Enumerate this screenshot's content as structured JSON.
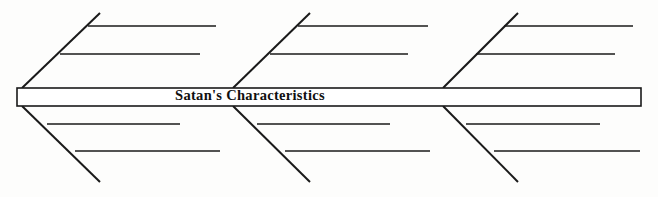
{
  "canvas": {
    "width": 658,
    "height": 197,
    "background_color": "#fdfdfc",
    "ink_color": "#1a1a1a"
  },
  "diagram": {
    "type": "fishbone",
    "alt_name": "Ishikawa cause-and-effect diagram",
    "effect_label": "Satan's Characteristics",
    "spine": {
      "x1": 17,
      "y1": 88,
      "x2": 641,
      "y2": 106,
      "stroke_width": 1.6,
      "fill_color": "#ffffff",
      "stroke_color": "#1a1a1a"
    },
    "label": {
      "text": "Satan's Characteristics",
      "center_x": 250,
      "center_y": 97,
      "font_size": 14.5,
      "bold": true,
      "color": "#101010"
    },
    "categories": [
      {
        "id": "left-upper",
        "position": "upper",
        "label": "",
        "main_bone": {
          "x1": 22,
          "y1": 88,
          "x2": 100,
          "y2": 13,
          "stroke_width": 2.0
        },
        "sub_bones": [
          {
            "label": "",
            "x1": 88,
            "y1": 26,
            "x2": 216,
            "y2": 26,
            "stroke_width": 1.4
          },
          {
            "label": "",
            "x1": 60,
            "y1": 54,
            "x2": 200,
            "y2": 54,
            "stroke_width": 1.4
          }
        ]
      },
      {
        "id": "left-lower",
        "position": "lower",
        "label": "",
        "main_bone": {
          "x1": 22,
          "y1": 106,
          "x2": 100,
          "y2": 182,
          "stroke_width": 2.0
        },
        "sub_bones": [
          {
            "label": "",
            "x1": 47,
            "y1": 124,
            "x2": 180,
            "y2": 124,
            "stroke_width": 1.4
          },
          {
            "label": "",
            "x1": 75,
            "y1": 151,
            "x2": 220,
            "y2": 151,
            "stroke_width": 1.4
          }
        ]
      },
      {
        "id": "middle-upper",
        "position": "upper",
        "label": "",
        "main_bone": {
          "x1": 233,
          "y1": 88,
          "x2": 310,
          "y2": 13,
          "stroke_width": 2.0
        },
        "sub_bones": [
          {
            "label": "",
            "x1": 298,
            "y1": 26,
            "x2": 428,
            "y2": 26,
            "stroke_width": 1.4
          },
          {
            "label": "",
            "x1": 270,
            "y1": 54,
            "x2": 408,
            "y2": 54,
            "stroke_width": 1.4
          }
        ]
      },
      {
        "id": "middle-lower",
        "position": "lower",
        "label": "",
        "main_bone": {
          "x1": 233,
          "y1": 106,
          "x2": 310,
          "y2": 182,
          "stroke_width": 2.0
        },
        "sub_bones": [
          {
            "label": "",
            "x1": 257,
            "y1": 124,
            "x2": 390,
            "y2": 124,
            "stroke_width": 1.4
          },
          {
            "label": "",
            "x1": 285,
            "y1": 151,
            "x2": 430,
            "y2": 151,
            "stroke_width": 1.4
          }
        ]
      },
      {
        "id": "right-upper",
        "position": "upper",
        "label": "",
        "main_bone": {
          "x1": 443,
          "y1": 88,
          "x2": 518,
          "y2": 13,
          "stroke_width": 2.0
        },
        "sub_bones": [
          {
            "label": "",
            "x1": 504,
            "y1": 26,
            "x2": 633,
            "y2": 26,
            "stroke_width": 1.4
          },
          {
            "label": "",
            "x1": 476,
            "y1": 54,
            "x2": 615,
            "y2": 54,
            "stroke_width": 1.4
          }
        ]
      },
      {
        "id": "right-lower",
        "position": "lower",
        "label": "",
        "main_bone": {
          "x1": 443,
          "y1": 106,
          "x2": 518,
          "y2": 182,
          "stroke_width": 2.0
        },
        "sub_bones": [
          {
            "label": "",
            "x1": 466,
            "y1": 124,
            "x2": 600,
            "y2": 124,
            "stroke_width": 1.4
          },
          {
            "label": "",
            "x1": 494,
            "y1": 151,
            "x2": 640,
            "y2": 151,
            "stroke_width": 1.4
          }
        ]
      }
    ]
  }
}
